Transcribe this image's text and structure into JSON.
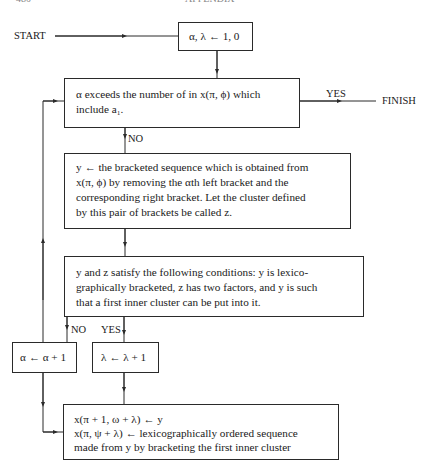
{
  "header": {
    "page_number": "480",
    "title": "APPENDIX"
  },
  "flowchart": {
    "start_label": "START",
    "finish_label": "FINISH",
    "init_box": "α, λ ← 1, 0",
    "decision1": {
      "line1": "α exceeds the number of in x(π, ϕ) which",
      "line2": "include a₁.",
      "yes_label": "YES",
      "no_label": "NO"
    },
    "process1": {
      "line1": "y ← the bracketed sequence which is obtained from",
      "line2": "x(π, ϕ) by removing the αth left bracket and the",
      "line3": "corresponding right bracket. Let the cluster defined",
      "line4": "by this pair of brackets be called z."
    },
    "decision2": {
      "line1": "y and z satisfy the following conditions: y is lexico-",
      "line2": "graphically bracketed, z has two factors, and y is such",
      "line3": "that a first inner cluster can be put into it.",
      "no_label": "NO",
      "yes_label": "YES"
    },
    "alpha_increment": "α ← α + 1",
    "lambda_increment": "λ ← λ + 1",
    "final_box": {
      "line1": "x(π + 1, ω + λ) ← y",
      "line2": "x(π, ψ + λ) ← lexicographically ordered sequence",
      "line3": "made from y by bracketing the first inner cluster"
    }
  }
}
